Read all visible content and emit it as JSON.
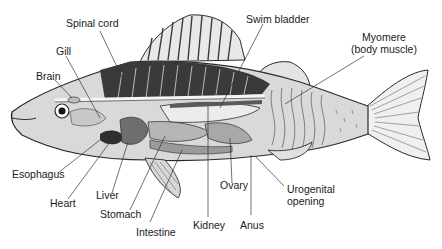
{
  "diagram": {
    "colors": {
      "background": "#ffffff",
      "body_fill": "#d9d9d9",
      "dark_muscle": "#3a3a3a",
      "organ_mid": "#8c8c8c",
      "organ_light": "#e6e6e6",
      "outline": "#2a2a2a",
      "leader_line": "#333333"
    },
    "labels": {
      "spinal_cord": "Spinal cord",
      "gill": "Gill",
      "brain": "Brain",
      "swim_bladder": "Swim bladder",
      "myomere_line1": "Myomere",
      "myomere_line2": "(body muscle)",
      "esophagus": "Esophagus",
      "heart": "Heart",
      "liver": "Liver",
      "stomach": "Stomach",
      "intestine": "Intestine",
      "kidney": "Kidney",
      "ovary": "Ovary",
      "anus": "Anus",
      "urogenital_line1": "Urogenital",
      "urogenital_line2": "opening"
    }
  }
}
